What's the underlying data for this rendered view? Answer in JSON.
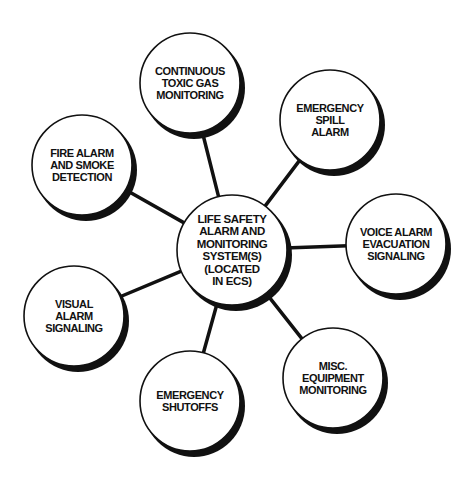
{
  "diagram": {
    "type": "hub-and-spoke",
    "center": {
      "id": "life-safety",
      "lines": [
        "LIFE SAFETY",
        "ALARM AND",
        "MONITORING",
        "SYSTEM(S)",
        "(LOCATED",
        "IN ECS)"
      ],
      "cx": 232,
      "cy": 250,
      "r": 55
    },
    "nodes": [
      {
        "id": "continuous-toxic-gas",
        "lines": [
          "CONTINUOUS",
          "TOXIC GAS",
          "MONITORING"
        ],
        "cx": 190,
        "cy": 83,
        "r": 50
      },
      {
        "id": "emergency-spill",
        "lines": [
          "EMERGENCY",
          "SPILL",
          "ALARM"
        ],
        "cx": 330,
        "cy": 120,
        "r": 50
      },
      {
        "id": "voice-alarm",
        "lines": [
          "VOICE ALARM",
          "EVACUATION",
          "SIGNALING"
        ],
        "cx": 396,
        "cy": 244,
        "r": 50
      },
      {
        "id": "misc-equipment",
        "lines": [
          "MISC.",
          "EQUIPMENT",
          "MONITORING"
        ],
        "cx": 333,
        "cy": 378,
        "r": 50
      },
      {
        "id": "emergency-shutoffs",
        "lines": [
          "EMERGENCY",
          "SHUTOFFS"
        ],
        "cx": 190,
        "cy": 401,
        "r": 50
      },
      {
        "id": "visual-alarm",
        "lines": [
          "VISUAL",
          "ALARM",
          "SIGNALING"
        ],
        "cx": 74,
        "cy": 316,
        "r": 50
      },
      {
        "id": "fire-alarm",
        "lines": [
          "FIRE ALARM",
          "AND SMOKE",
          "DETECTION"
        ],
        "cx": 82,
        "cy": 165,
        "r": 50
      }
    ],
    "colors": {
      "ink": "#111111",
      "fill": "#ffffff",
      "background": "#ffffff"
    }
  }
}
